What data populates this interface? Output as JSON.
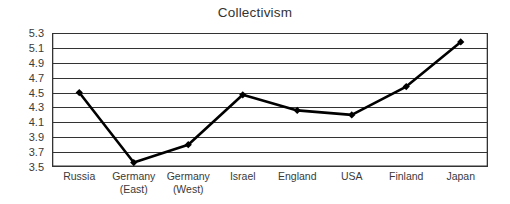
{
  "chart_data": {
    "type": "line",
    "title": "Collectivism",
    "xlabel": "",
    "ylabel": "",
    "categories": [
      "Russia",
      "Germany (East)",
      "Germany (West)",
      "Israel",
      "England",
      "USA",
      "Finland",
      "Japan"
    ],
    "category_lines": [
      [
        "Russia",
        ""
      ],
      [
        "Germany",
        "(East)"
      ],
      [
        "Germany",
        "(West)"
      ],
      [
        "Israel",
        ""
      ],
      [
        "England",
        ""
      ],
      [
        "USA",
        ""
      ],
      [
        "Finland",
        ""
      ],
      [
        "Japan",
        ""
      ]
    ],
    "values": [
      4.5,
      3.56,
      3.8,
      4.47,
      4.26,
      4.2,
      4.58,
      5.18
    ],
    "ylim": [
      3.5,
      5.3
    ],
    "ytick_step": 0.2,
    "ytick_labels": [
      "5.3",
      "5.1",
      "4.9",
      "4.7",
      "4.5",
      "4.3",
      "4.1",
      "3.9",
      "3.7",
      "3.5"
    ],
    "ytick_values": [
      5.3,
      5.1,
      4.9,
      4.7,
      4.5,
      4.3,
      4.1,
      3.9,
      3.7,
      3.5
    ],
    "grid": true,
    "grid_orientation": "horizontal",
    "legend": false,
    "legend_position": "none",
    "marker": "diamond",
    "series_color": "#000000",
    "grid_color": "#333333",
    "axis_color": "#333333",
    "background_color": "#ffffff",
    "series": [
      {
        "name": "Collectivism",
        "values": [
          4.5,
          3.56,
          3.8,
          4.47,
          4.26,
          4.2,
          4.58,
          5.18
        ]
      }
    ]
  }
}
